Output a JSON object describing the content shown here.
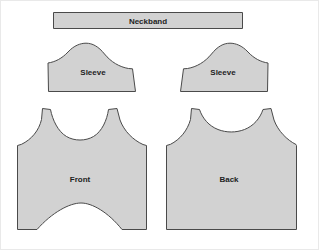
{
  "sheet": {
    "title": "Garment Pattern Pieces",
    "background_color": "#ffffff",
    "frame_color": "#e9e9e9",
    "width": 319,
    "height": 250
  },
  "style": {
    "piece_fill": "#d2d2d2",
    "piece_stroke": "#4a4a4a",
    "label_color": "#1e1e1e",
    "texture_color": "#c4c4c4"
  },
  "pieces": [
    {
      "id": "neckband",
      "label": "Neckband",
      "type": "rectangle",
      "label_x": 148,
      "label_y": 21,
      "bounds": {
        "x": 53,
        "y": 12,
        "width": 190,
        "height": 17
      }
    },
    {
      "id": "sleeve-left",
      "label": "Sleeve",
      "type": "sleeve",
      "label_x": 95,
      "label_y": 73,
      "bounds": {
        "x": 48,
        "y": 43,
        "width": 95,
        "height": 49
      }
    },
    {
      "id": "sleeve-right",
      "label": "Sleeve",
      "type": "sleeve",
      "label_x": 207,
      "label_y": 73,
      "bounds": {
        "x": 173,
        "y": 43,
        "width": 95,
        "height": 49
      }
    },
    {
      "id": "bodice-front",
      "label": "Front",
      "type": "bodice-front",
      "label_x": 80,
      "label_y": 180,
      "bounds": {
        "x": 17,
        "y": 108,
        "width": 130,
        "height": 126
      }
    },
    {
      "id": "bodice-back",
      "label": "Back",
      "type": "bodice-back",
      "label_x": 229,
      "label_y": 180,
      "bounds": {
        "x": 166,
        "y": 108,
        "width": 130,
        "height": 126
      }
    }
  ]
}
